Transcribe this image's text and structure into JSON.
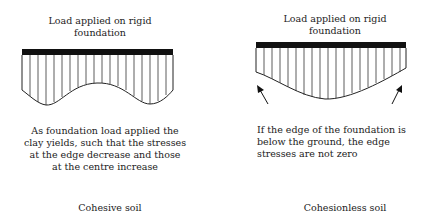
{
  "left_panel": {
    "title_line1": "Load applied on rigid",
    "title_line2": "foundation",
    "desc_line1": "As foundation load applied the",
    "desc_line2": "clay yields, such that the stresses",
    "desc_line3": "at the edge decrease and those",
    "desc_line4": "at the centre increase",
    "label": "Cohesive soil"
  },
  "right_panel": {
    "title_line1": "Load applied on rigid",
    "title_line2": "foundation",
    "desc_line1": "If the edge of the foundation is",
    "desc_line2": "below the ground, the edge",
    "desc_line3": "stresses are not zero",
    "label": "Cohesionless soil"
  },
  "colors": {
    "ink": "#111111",
    "text": "#222222"
  }
}
